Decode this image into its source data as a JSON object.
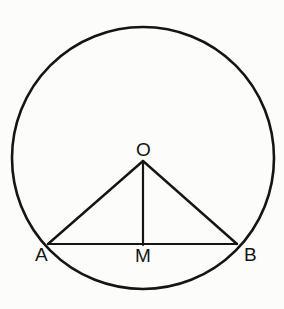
{
  "figure": {
    "background_color": "#fcfcfa",
    "stroke_color": "#151515",
    "canvas": {
      "width": 284,
      "height": 309
    }
  },
  "geometry": {
    "circle": {
      "name": "circle",
      "center_x": 143,
      "center_y": 158,
      "radius": 131,
      "stroke_width": 2.6
    },
    "points": [
      {
        "id": "O",
        "label": "O",
        "x": 143,
        "y": 161,
        "role": "centre"
      },
      {
        "id": "A",
        "label": "A",
        "x": 48,
        "y": 244,
        "role": "chord-endpoint"
      },
      {
        "id": "M",
        "label": "M",
        "x": 143,
        "y": 244,
        "role": "chord-midpoint"
      },
      {
        "id": "B",
        "label": "B",
        "x": 237,
        "y": 244,
        "role": "chord-endpoint"
      }
    ],
    "segments": [
      {
        "id": "OA",
        "from": "O",
        "to": "A",
        "label": "radius OA",
        "stroke_width": 2.4
      },
      {
        "id": "OB",
        "from": "O",
        "to": "B",
        "label": "radius OB",
        "stroke_width": 2.4
      },
      {
        "id": "AB",
        "from": "A",
        "to": "B",
        "label": "chord AB",
        "stroke_width": 2.2
      },
      {
        "id": "OM",
        "from": "O",
        "to": "M",
        "label": "perpendicular OM",
        "stroke_width": 2.2
      }
    ]
  },
  "labels": {
    "O": "O",
    "A": "A",
    "M": "M",
    "B": "B"
  },
  "background_text": {
    "note": "Faint mirrored show-through from the reverse side of the scanned page; not legible.",
    "lines": [
      "",
      "",
      "",
      "",
      ""
    ]
  }
}
